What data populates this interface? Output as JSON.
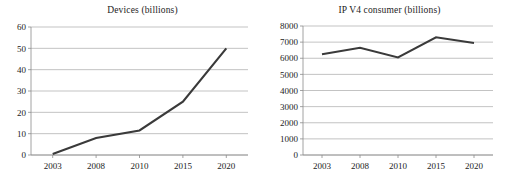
{
  "figure": {
    "width": 506,
    "height": 183,
    "background": "#ffffff",
    "line_color": "#3a3a3a",
    "grid_color": "#a9a9a9",
    "axis_color": "#8c8c8c",
    "text_color": "#1c1c1c"
  },
  "chart_data": [
    {
      "type": "line",
      "id": "devices",
      "title": "Devices (billions)",
      "xlabel": "",
      "ylabel": "",
      "categories": [
        "2003",
        "2008",
        "2010",
        "2015",
        "2020"
      ],
      "x": [
        2003,
        2008,
        2010,
        2015,
        2020
      ],
      "values": [
        0.5,
        8,
        11.5,
        25,
        50
      ],
      "series": [
        {
          "name": "Devices (billions)",
          "values": [
            0.5,
            8,
            11.5,
            25,
            50
          ]
        }
      ],
      "ylim": [
        0,
        60
      ],
      "yticks": [
        0,
        10,
        20,
        30,
        40,
        50,
        60
      ],
      "ytick_labels": [
        "0",
        "10",
        "20",
        "30",
        "40",
        "50",
        "60"
      ],
      "xtick_labels": [
        "2003",
        "2008",
        "2010",
        "2015",
        "2020"
      ],
      "grid": true,
      "grid_axis": "y",
      "legend": false,
      "legend_position": "none"
    },
    {
      "type": "line",
      "id": "ipv4",
      "title": "IP V4 consumer (billions)",
      "xlabel": "",
      "ylabel": "",
      "categories": [
        "2003",
        "2008",
        "2010",
        "2015",
        "2020"
      ],
      "x": [
        2003,
        2008,
        2010,
        2015,
        2020
      ],
      "values": [
        6250,
        6650,
        6050,
        7300,
        6950
      ],
      "series": [
        {
          "name": "IP V4 consumer (billions)",
          "values": [
            6250,
            6650,
            6050,
            7300,
            6950
          ]
        }
      ],
      "ylim": [
        0,
        8000
      ],
      "yticks": [
        0,
        1000,
        2000,
        3000,
        4000,
        5000,
        6000,
        7000,
        8000
      ],
      "ytick_labels": [
        "0",
        "1000",
        "2000",
        "3000",
        "4000",
        "5000",
        "6000",
        "7000",
        "8000"
      ],
      "xtick_labels": [
        "2003",
        "2008",
        "2010",
        "2015",
        "2020"
      ],
      "grid": true,
      "grid_axis": "y",
      "legend": false,
      "legend_position": "none"
    }
  ]
}
